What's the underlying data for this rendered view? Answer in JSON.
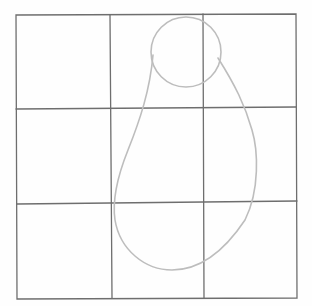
{
  "image": {
    "description": "Pencil sketch of a 3x3 grid with a pear / gourd outline drawn over the center and right columns",
    "background_color": "#fefefe",
    "grid_color": "#6e6e6e",
    "shape_color": "#bdbdbd"
  },
  "grid": {
    "rows": 3,
    "cols": 3,
    "x_lines": [
      16,
      110,
      204,
      296
    ],
    "y_lines": [
      15,
      108,
      202,
      298
    ]
  },
  "shape": {
    "type": "pear-outline",
    "head_circle": {
      "cx": 186,
      "cy": 52,
      "r": 35
    },
    "body_bottom": {
      "x": 172,
      "y": 270
    }
  }
}
